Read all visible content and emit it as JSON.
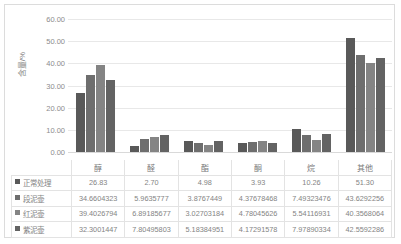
{
  "chart_data": {
    "type": "bar",
    "title": "",
    "xlabel": "",
    "ylabel": "含量/%",
    "ylim": [
      0,
      60
    ],
    "ytick_labels": [
      "60.00",
      "50.00",
      "40.00",
      "30.00",
      "20.00",
      "10.00",
      "0.00"
    ],
    "ytick_values": [
      60,
      50,
      40,
      30,
      20,
      10,
      0
    ],
    "grid": true,
    "legend_position": "data-table",
    "categories": [
      "醇",
      "醛",
      "酯",
      "酮",
      "烷",
      "其他"
    ],
    "series": [
      {
        "name": "正常处理",
        "color": "#595959",
        "values": [
          26.83,
          2.7,
          4.98,
          3.93,
          10.26,
          51.3
        ],
        "labels": [
          "26.83",
          "2.70",
          "4.98",
          "3.93",
          "10.26",
          "51.30"
        ]
      },
      {
        "name": "段泥壶",
        "color": "#6e6e6e",
        "values": [
          34.6604323,
          5.9635777,
          3.8767449,
          4.37678468,
          7.49323476,
          43.6292256
        ],
        "labels": [
          "34.6604323",
          "5.9635777",
          "3.8767449",
          "4.37678468",
          "7.49323476",
          "43.6292256"
        ]
      },
      {
        "name": "红泥壶",
        "color": "#848484",
        "values": [
          39.4026794,
          6.89185677,
          3.02703184,
          4.78045626,
          5.54116931,
          40.3568064
        ],
        "labels": [
          "39.4026794",
          "6.89185677",
          "3.02703184",
          "4.78045626",
          "5.54116931",
          "40.3568064"
        ]
      },
      {
        "name": "紫泥壶",
        "color": "#636363",
        "values": [
          32.3001447,
          7.80495803,
          5.18384951,
          4.17291578,
          7.97890334,
          42.5592286
        ],
        "labels": [
          "32.3001447",
          "7.80495803",
          "5.18384951",
          "4.17291578",
          "7.97890334",
          "42.5592286"
        ]
      }
    ]
  },
  "colors": {
    "frame_border": "#dcdcdc",
    "gridline": "#e8e8e8",
    "table_border": "#e3e3e3",
    "text": "#848484"
  }
}
